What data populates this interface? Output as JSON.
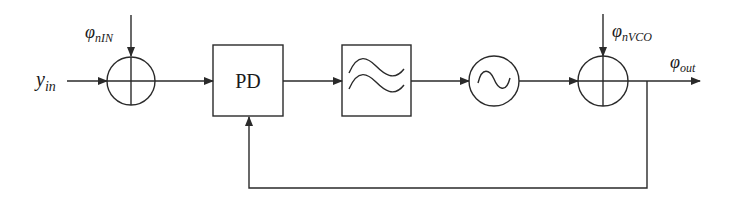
{
  "diagram": {
    "colors": {
      "stroke": "#2a2a2a",
      "background": "#ffffff"
    },
    "labels": {
      "input": {
        "main": "y",
        "sub": "in"
      },
      "input_noise": {
        "main": "φ",
        "sub": "nIN"
      },
      "vco_noise": {
        "main": "φ",
        "sub": "nVCO"
      },
      "output": {
        "main": "φ",
        "sub": "out"
      },
      "phase_detector": "PD"
    },
    "blocks": [
      {
        "id": "summer-input",
        "type": "summing-junction"
      },
      {
        "id": "phase-detector",
        "type": "box",
        "label": "PD"
      },
      {
        "id": "loop-filter",
        "type": "box",
        "icon": "filter-icon"
      },
      {
        "id": "vco",
        "type": "circle",
        "icon": "oscillator-icon"
      },
      {
        "id": "summer-output",
        "type": "summing-junction"
      }
    ],
    "connections": [
      "y_in -> summer-input",
      "φnIN -> summer-input",
      "summer-input -> phase-detector",
      "phase-detector -> loop-filter",
      "loop-filter -> vco",
      "vco -> summer-output",
      "φnVCO -> summer-output",
      "summer-output -> φout",
      "φout -> phase-detector (feedback)"
    ]
  }
}
